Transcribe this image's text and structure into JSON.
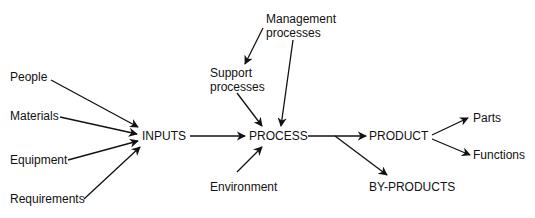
{
  "diagram": {
    "nodes": {
      "people": "People",
      "materials": "Materials",
      "equipment": "Equipment",
      "requirements": "Requirements",
      "inputs": "INPUTS",
      "process": "PROCESS",
      "product": "PRODUCT",
      "byproducts": "BY-PRODUCTS",
      "parts": "Parts",
      "functions": "Functions",
      "environment": "Environment",
      "support_line1": "Support",
      "support_line2": "processes",
      "management_line1": "Management",
      "management_line2": "processes"
    },
    "edges": [
      [
        "People",
        "INPUTS"
      ],
      [
        "Materials",
        "INPUTS"
      ],
      [
        "Equipment",
        "INPUTS"
      ],
      [
        "Requirements",
        "INPUTS"
      ],
      [
        "INPUTS",
        "PROCESS"
      ],
      [
        "Management processes",
        "Support processes"
      ],
      [
        "Management processes",
        "PROCESS"
      ],
      [
        "Support processes",
        "PROCESS"
      ],
      [
        "Environment",
        "PROCESS"
      ],
      [
        "PROCESS",
        "PRODUCT"
      ],
      [
        "PROCESS",
        "BY-PRODUCTS"
      ],
      [
        "PRODUCT",
        "Parts"
      ],
      [
        "PRODUCT",
        "Functions"
      ]
    ]
  }
}
